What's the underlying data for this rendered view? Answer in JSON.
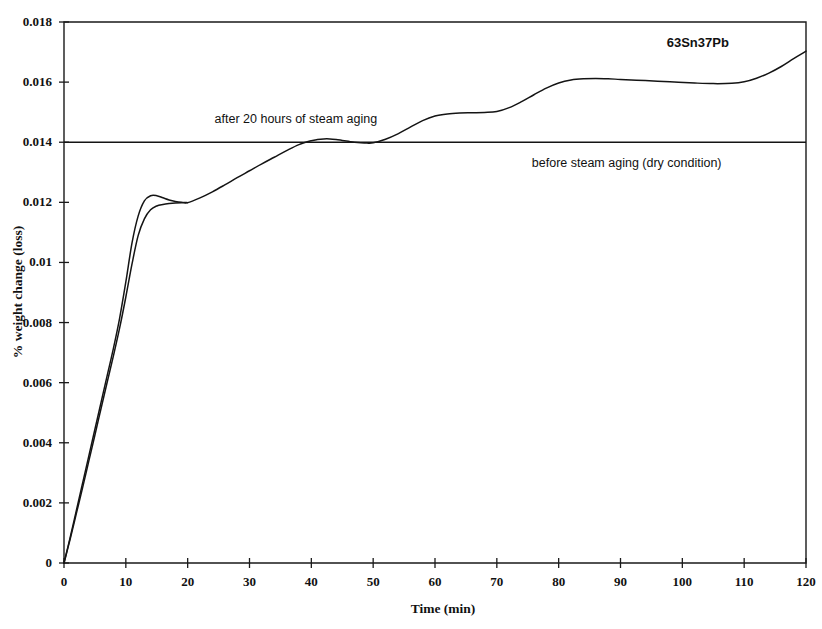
{
  "chart_data": {
    "type": "line",
    "title": "",
    "sample_label": "63Sn37Pb",
    "xlabel": "Time (min)",
    "ylabel": "% weight change (loss)",
    "xlim": [
      0,
      120
    ],
    "ylim": [
      0,
      0.018
    ],
    "xticks": [
      0,
      10,
      20,
      30,
      40,
      50,
      60,
      70,
      80,
      90,
      100,
      110,
      120
    ],
    "xtick_labels": [
      "0",
      "10",
      "20",
      "30",
      "40",
      "50",
      "60",
      "70",
      "80",
      "90",
      "100",
      "110",
      "120"
    ],
    "yticks": [
      0,
      0.002,
      0.004,
      0.006,
      0.008,
      0.01,
      0.012,
      0.014,
      0.016,
      0.018
    ],
    "ytick_labels": [
      "0",
      "0.002",
      "0.004",
      "0.006",
      "0.008",
      "0.01",
      "0.012",
      "0.014",
      "0.016",
      "0.018"
    ],
    "grid": false,
    "legend_position": "none",
    "line_color": "#141414",
    "series": [
      {
        "name": "after 20 hours of steam aging",
        "x": [
          0,
          1,
          2,
          3,
          4,
          5,
          6,
          7,
          8,
          9,
          10,
          11,
          12,
          13,
          14,
          15,
          16,
          17,
          18,
          19,
          20,
          22,
          24,
          26,
          28,
          30,
          32,
          34,
          36,
          38,
          40,
          41,
          42,
          43,
          44,
          45,
          46,
          47,
          48,
          49,
          50,
          52,
          54,
          56,
          58,
          60,
          62,
          64,
          66,
          68,
          70,
          72,
          74,
          76,
          78,
          80,
          82,
          84,
          86,
          88,
          90,
          94,
          98,
          102,
          105,
          108,
          110,
          112,
          114,
          116,
          118,
          120
        ],
        "y": [
          0.0,
          0.00085,
          0.00175,
          0.00265,
          0.00355,
          0.00445,
          0.00535,
          0.00625,
          0.00715,
          0.00815,
          0.00935,
          0.01065,
          0.01155,
          0.01205,
          0.01222,
          0.01222,
          0.01215,
          0.01208,
          0.01203,
          0.012,
          0.01199,
          0.01215,
          0.01235,
          0.01258,
          0.01282,
          0.01305,
          0.01328,
          0.0135,
          0.01372,
          0.01392,
          0.01405,
          0.01409,
          0.01411,
          0.01411,
          0.01409,
          0.01406,
          0.01403,
          0.014,
          0.01398,
          0.01397,
          0.01398,
          0.0141,
          0.01428,
          0.0145,
          0.01472,
          0.01487,
          0.01494,
          0.01497,
          0.01498,
          0.01499,
          0.01502,
          0.01515,
          0.01535,
          0.01558,
          0.0158,
          0.01597,
          0.01607,
          0.01611,
          0.01612,
          0.01611,
          0.01609,
          0.01605,
          0.01601,
          0.01597,
          0.01595,
          0.01596,
          0.01601,
          0.01613,
          0.0163,
          0.01652,
          0.01678,
          0.01703
        ]
      },
      {
        "name": "after 20 hours of steam aging (second run)",
        "x": [
          0,
          1,
          2,
          3,
          4,
          5,
          6,
          7,
          8,
          9,
          10,
          11,
          12,
          13,
          14,
          15,
          16,
          17,
          18,
          19,
          20
        ],
        "y": [
          0.0,
          0.0008,
          0.00165,
          0.0025,
          0.00338,
          0.00426,
          0.00515,
          0.00603,
          0.0069,
          0.00782,
          0.00885,
          0.00995,
          0.0109,
          0.01145,
          0.01175,
          0.01188,
          0.01193,
          0.01196,
          0.01198,
          0.01199,
          0.01199
        ]
      },
      {
        "name": "before steam aging (dry condition)",
        "x": [
          0,
          120
        ],
        "y": [
          0.014,
          0.014
        ]
      }
    ],
    "annotations": [
      {
        "id": "annotation-after-aging",
        "text": "after 20 hours of steam aging",
        "x": 37.5,
        "y": 0.01465,
        "anchor": "mid"
      },
      {
        "id": "annotation-before-aging",
        "text": "before steam aging (dry condition)",
        "x": 91.0,
        "y": 0.01318,
        "anchor": "mid"
      },
      {
        "id": "annotation-sample",
        "text": "63Sn37Pb",
        "x": 102.5,
        "y": 0.01718,
        "anchor": "mid"
      }
    ]
  }
}
